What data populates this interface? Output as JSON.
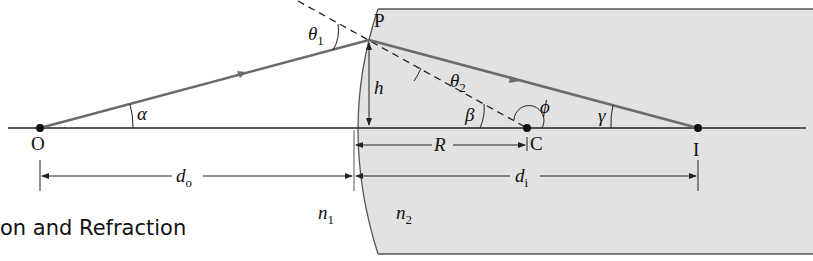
{
  "figure": {
    "caption_fragment": "on and Refraction",
    "colors": {
      "medium_fill": "#e2e2e2",
      "medium_edge": "#555555",
      "ray": "#6b6b6b",
      "axis": "#222222",
      "background": "#ffffff"
    },
    "points": {
      "object": "O",
      "incidence_point": "P",
      "center": "C",
      "image": "I"
    },
    "angles": {
      "alpha": "α",
      "beta": "β",
      "gamma": "γ",
      "phi": "ϕ",
      "theta1": "θ",
      "theta1_sub": "1",
      "theta2": "θ",
      "theta2_sub": "2"
    },
    "lengths": {
      "height": "h",
      "radius": "R",
      "object_distance": "d",
      "object_distance_sub": "o",
      "image_distance": "d",
      "image_distance_sub": "i"
    },
    "media": {
      "n1": "n",
      "n1_sub": "1",
      "n2": "n",
      "n2_sub": "2"
    }
  }
}
